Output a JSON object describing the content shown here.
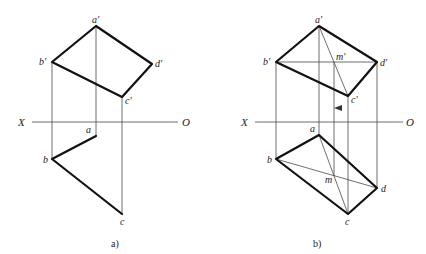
{
  "figures": [
    {
      "id": "a",
      "caption": "a)",
      "axis": {
        "left_label": "X",
        "right_label": "O"
      },
      "labels": {
        "a_prime": "a′",
        "b_prime": "b′",
        "c_prime": "c′",
        "d_prime": "d′",
        "a": "a",
        "b": "b",
        "c": "c"
      }
    },
    {
      "id": "b",
      "caption": "b)",
      "axis": {
        "left_label": "X",
        "right_label": "O"
      },
      "labels": {
        "a_prime": "a′",
        "b_prime": "b′",
        "c_prime": "c′",
        "d_prime": "d′",
        "m_prime": "m′",
        "a": "a",
        "b": "b",
        "c": "c",
        "d": "d",
        "m": "m"
      }
    }
  ],
  "colors": {
    "thick_line": "#111111",
    "thin_line": "#4a4a4a",
    "background": "#ffffff"
  }
}
